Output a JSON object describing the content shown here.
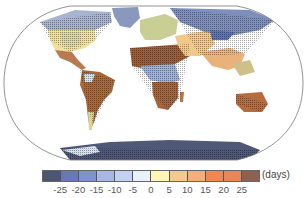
{
  "map": {
    "projection": "Robinson (global)",
    "description": "Global map of projected change in number of days; warm browns/oranges over Sahara, southern Africa, Australia, Amazon, Mexico; blues over Siberia, Greenland, Antarctica, high northern latitudes and East Africa",
    "regions": [
      {
        "name": "North America (north/Canada)",
        "tone": "blue"
      },
      {
        "name": "North America (USA)",
        "tone": "yellow"
      },
      {
        "name": "Mexico/Central America",
        "tone": "brown"
      },
      {
        "name": "South America (Amazon)",
        "tone": "brown"
      },
      {
        "name": "Europe",
        "tone": "yellow-green"
      },
      {
        "name": "Sahara/North Africa",
        "tone": "brown"
      },
      {
        "name": "East Africa",
        "tone": "blue"
      },
      {
        "name": "Southern Africa",
        "tone": "brown"
      },
      {
        "name": "Siberia/North Asia",
        "tone": "blue"
      },
      {
        "name": "Central/South Asia",
        "tone": "orange"
      },
      {
        "name": "Australia",
        "tone": "brown"
      },
      {
        "name": "Greenland",
        "tone": "blue"
      },
      {
        "name": "Antarctica",
        "tone": "dark-blue"
      }
    ]
  },
  "colorbar": {
    "units_label": "(days)",
    "ticks": [
      "-25",
      "-20",
      "-15",
      "-10",
      "-5",
      "0",
      "5",
      "10",
      "15",
      "20",
      "25"
    ],
    "colors": [
      "#4d5670",
      "#6878b8",
      "#7f92cc",
      "#a9b8e2",
      "#c3d2f0",
      "#e9f1f8",
      "#fdf6b4",
      "#f6c98a",
      "#f4ae7a",
      "#f0874e",
      "#e8865a",
      "#8c6152"
    ]
  }
}
